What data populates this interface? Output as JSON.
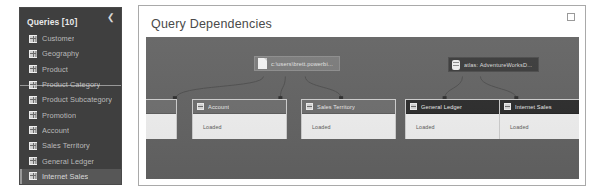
{
  "queries_pane": {
    "title": "Queries [10]",
    "collapse_icon": "chevron-left-icon",
    "items": [
      {
        "label": "Customer"
      },
      {
        "label": "Geography"
      },
      {
        "label": "Product"
      },
      {
        "label": "Product Category"
      },
      {
        "label": "Product Subcategory"
      },
      {
        "label": "Promotion"
      },
      {
        "label": "Account"
      },
      {
        "label": "Sales Territory"
      },
      {
        "label": "General Ledger"
      },
      {
        "label": "Internet Sales"
      }
    ]
  },
  "dialog": {
    "title": "Query Dependencies",
    "restore_icon": "restore-window-icon"
  },
  "graph": {
    "sources": [
      {
        "label": "c:\\users\\brett.powerbi...",
        "icon": "file-icon",
        "style": "light"
      },
      {
        "label": "atlas: AdventureWorksD...",
        "icon": "database-icon",
        "style": "dark"
      }
    ],
    "cards": [
      {
        "label": "",
        "status": "",
        "active": false
      },
      {
        "label": "Account",
        "status": "Loaded",
        "active": false
      },
      {
        "label": "Sales Territory",
        "status": "Loaded",
        "active": false
      },
      {
        "label": "General Ledger",
        "status": "Loaded",
        "active": true
      },
      {
        "label": "Internet Sales",
        "status": "Loaded",
        "active": true
      }
    ]
  },
  "colors": {
    "pane_bg": "#3f3f3f",
    "canvas_bg": "#646464",
    "card_bg": "#e9e9e9",
    "card_head": "#6f6f6f",
    "card_head_active": "#2d2d2d"
  }
}
